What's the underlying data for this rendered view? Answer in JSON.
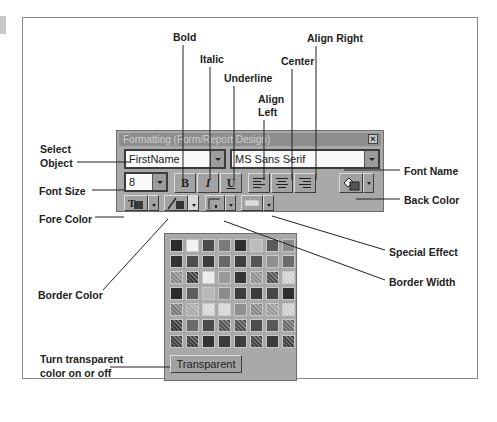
{
  "window": {
    "title": "Formatting (Form/Report Design)",
    "close_glyph": "×"
  },
  "toolbar": {
    "select_object_value": "FirstName",
    "font_name_value": "MS Sans Serif",
    "font_size_value": "8",
    "bold_glyph": "B",
    "italic_glyph": "I",
    "underline_glyph": "U"
  },
  "palette": {
    "transparent_label": "Transparent",
    "swatches": [
      "#2c2c2c",
      "#f2f2f2",
      "#4a4a4a",
      "#7a7a7a",
      "#2f2f2f",
      "#bdbdbd",
      "#5a5a5a",
      "#8a8a8a",
      "#333333",
      "#4e4e4e",
      "#3a3a3a",
      "#686868",
      "#3e3e3e",
      "#555555",
      "#8e8e8e",
      "#6a6a6a",
      "#8a8a8a",
      "#3a3a3a",
      "#ececec",
      "#9a9a9a",
      "#353535",
      "#909090",
      "#505050",
      "#d2d2d2",
      "#2a2a2a",
      "#5c5c5c",
      "#b8b8b8",
      "#8c8c8c",
      "#3c3c3c",
      "#3a3a3a",
      "#474747",
      "#2e2e2e",
      "#7a7a7a",
      "#a8a8a8",
      "#d8d8d8",
      "#dcdcdc",
      "#8e8e8e",
      "#888888",
      "#9a9a9a",
      "#cfcfcf",
      "#3a3a3a",
      "#6a6a6a",
      "#4a4a4a",
      "#555555",
      "#505050",
      "#4d4d4d",
      "#595959",
      "#6a6a6a",
      "#444444",
      "#3e3e3e",
      "#333333",
      "#3a3a3a",
      "#3d3d3d",
      "#454545",
      "#3b3b3b",
      "#404040"
    ],
    "patterned": [
      16,
      17,
      21,
      22,
      23,
      32,
      33,
      34,
      37,
      38,
      39,
      40,
      43,
      44,
      47,
      48,
      49,
      53,
      55
    ]
  },
  "callouts": {
    "bold": "Bold",
    "italic": "Italic",
    "underline": "Underline",
    "align_left_1": "Align",
    "align_left_2": "Left",
    "center": "Center",
    "align_right": "Align Right",
    "select_object_1": "Select",
    "select_object_2": "Object",
    "font_size": "Font Size",
    "fore_color": "Fore Color",
    "border_color": "Border Color",
    "font_name": "Font Name",
    "back_color": "Back Color",
    "special_effect": "Special Effect",
    "border_width": "Border Width",
    "transparent_1": "Turn transparent",
    "transparent_2": "color on or off"
  }
}
